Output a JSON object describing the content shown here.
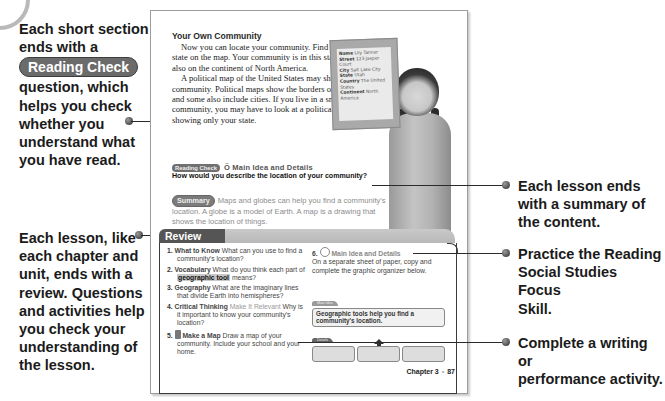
{
  "callouts": {
    "reading_check": {
      "line1": "Each short section",
      "line2": "ends with a",
      "pill": "Reading Check",
      "line3": "question, which",
      "line4": "helps you check",
      "line5": "whether you",
      "line6": "understand what",
      "line7": "you have read."
    },
    "review": [
      "Each lesson, like",
      "each chapter and",
      "unit, ends with a",
      "review. Questions",
      "and activities help",
      "you check your",
      "understanding of",
      "the lesson."
    ],
    "summary": [
      "Each lesson ends",
      "with a summary of",
      "the content."
    ],
    "focus_skill": [
      "Practice the Reading",
      "Social Studies Focus",
      "Skill."
    ],
    "activity": [
      "Complete a writing or",
      "performance activity."
    ]
  },
  "page": {
    "section_title": "Your Own Community",
    "paragraphs": [
      "Now you can locate your community. Find your state on the map. Your community is in this state. It is also on the continent of North America.",
      "A political map of the United States may show your community. Political maps show the borders of states, and some also include cities. If you live in a small community, you may have to look at a political map showing only your state."
    ],
    "reading_check": {
      "badge": "Reading Check",
      "skill": "Main Idea and Details",
      "question": "How would you describe the location of your community?"
    },
    "summary": {
      "badge": "Summary",
      "text": "Maps and globes can help you find a community's location. A globe is a model of Earth. A map is a drawing that shows the location of things."
    },
    "sign": {
      "name_label": "Name",
      "name": "Lily Tanner",
      "street_label": "Street",
      "street": "123 Jasper Court",
      "city_label": "City",
      "city": "Salt Lake City",
      "state_label": "State",
      "state": "Utah",
      "country_label": "Country",
      "country": "The United States",
      "continent_label": "Continent",
      "continent": "North America"
    },
    "review": {
      "title": "Review",
      "questions": [
        {
          "num": "1.",
          "label": "What to Know",
          "text": "What can you use to find a community's location?"
        },
        {
          "num": "2.",
          "label": "Vocabulary",
          "pre": "What do you think each part of",
          "highlight": "geographic tool",
          "post": "means?"
        },
        {
          "num": "3.",
          "label": "Geography",
          "text": "What are the imaginary lines that divide Earth into hemispheres?"
        },
        {
          "num": "4.",
          "label": "Critical Thinking",
          "label2": "Make It Relevant",
          "text": "Why is it important to know your community's location?"
        },
        {
          "num": "5.",
          "label": "Make a Map",
          "text": "Draw a map of your community. Include your school and your home."
        }
      ],
      "q6": {
        "num": "6.",
        "skill": "Main Idea and Details",
        "text": "On a separate sheet of paper, copy and complete the graphic organizer below."
      },
      "organizer": {
        "main_label": "Main Idea",
        "main_text": "Geographic tools help you find a community's location.",
        "details_label": "Details"
      }
    },
    "footer": {
      "chapter": "Chapter 3",
      "sep": "•",
      "page": "87"
    }
  }
}
